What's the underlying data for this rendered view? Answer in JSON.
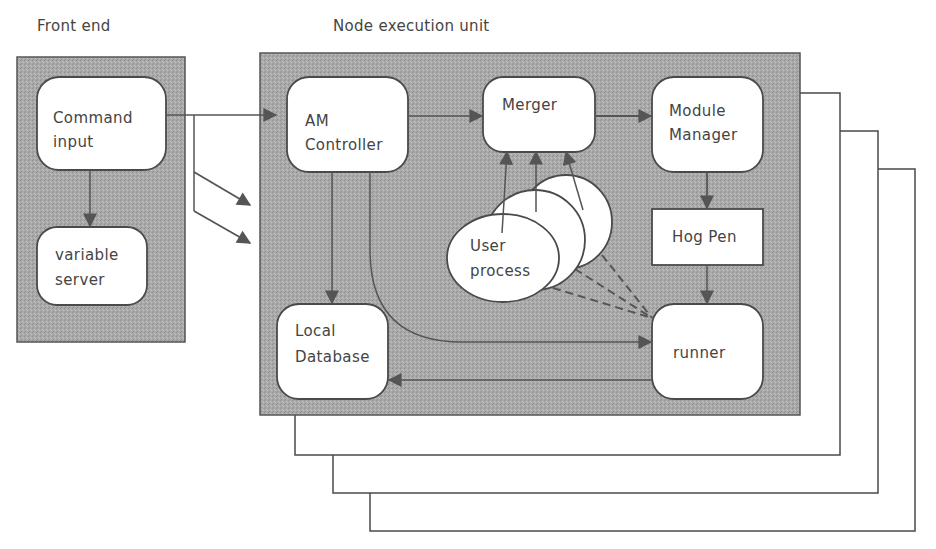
{
  "diagram": {
    "type": "architecture-block-diagram",
    "colors": {
      "panel_fill": "#a6a6a6",
      "box_fill": "#ffffff",
      "stroke": "#4a4a4a",
      "text": "#444444"
    },
    "groups": {
      "front_end": {
        "label": "Front end"
      },
      "node_unit": {
        "label": "Node execution unit",
        "stacked_copies": 3
      }
    },
    "nodes": {
      "command_input": {
        "line1": "Command",
        "line2": "input"
      },
      "variable_server": {
        "line1": "variable",
        "line2": "server"
      },
      "am_controller": {
        "line1": "AM",
        "line2": "Controller"
      },
      "merger": {
        "line1": "Merger"
      },
      "module_manager": {
        "line1": "Module",
        "line2": "Manager"
      },
      "hog_pen": {
        "line1": "Hog Pen"
      },
      "runner": {
        "line1": "runner"
      },
      "local_database": {
        "line1": "Local",
        "line2": "Database"
      },
      "user_process": {
        "line1": "User",
        "line2": "process",
        "stacked_copies": 3
      }
    },
    "edges": [
      {
        "from": "Command input",
        "to": "variable server",
        "style": "solid"
      },
      {
        "from": "Command input",
        "to": "AM Controller",
        "style": "solid"
      },
      {
        "from": "Command input",
        "to": "Node execution unit (copy 2)",
        "style": "solid"
      },
      {
        "from": "Command input",
        "to": "Node execution unit (copy 3)",
        "style": "solid"
      },
      {
        "from": "AM Controller",
        "to": "Merger",
        "style": "solid"
      },
      {
        "from": "AM Controller",
        "to": "Local Database",
        "style": "solid"
      },
      {
        "from": "AM Controller",
        "to": "runner",
        "style": "solid-curved"
      },
      {
        "from": "Merger",
        "to": "Module Manager",
        "style": "solid"
      },
      {
        "from": "User process (x3)",
        "to": "Merger",
        "style": "solid"
      },
      {
        "from": "Module Manager",
        "to": "Hog Pen",
        "style": "solid"
      },
      {
        "from": "Hog Pen",
        "to": "runner",
        "style": "solid"
      },
      {
        "from": "runner",
        "to": "Local Database",
        "style": "solid"
      },
      {
        "from": "runner",
        "to": "User process (x3)",
        "style": "dashed"
      }
    ]
  }
}
